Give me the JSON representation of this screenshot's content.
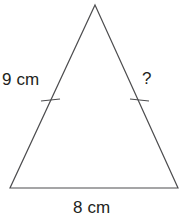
{
  "figure": {
    "type": "isosceles-triangle-diagram",
    "background_color": "#ffffff",
    "stroke_color": "#4d4d4f",
    "text_color": "#231f20",
    "labels": {
      "left_side": "9 cm",
      "right_side": "?",
      "base": "8 cm"
    },
    "geometry": {
      "apex": {
        "x": 95,
        "y": 5
      },
      "bottom_left": {
        "x": 10,
        "y": 188
      },
      "bottom_right": {
        "x": 178,
        "y": 188
      },
      "left_tick": {
        "x": 50,
        "y": 100
      },
      "right_tick": {
        "x": 139,
        "y": 100
      }
    },
    "tick_marks": 2,
    "congruence_note": "single tick on each of the two slanted sides"
  }
}
